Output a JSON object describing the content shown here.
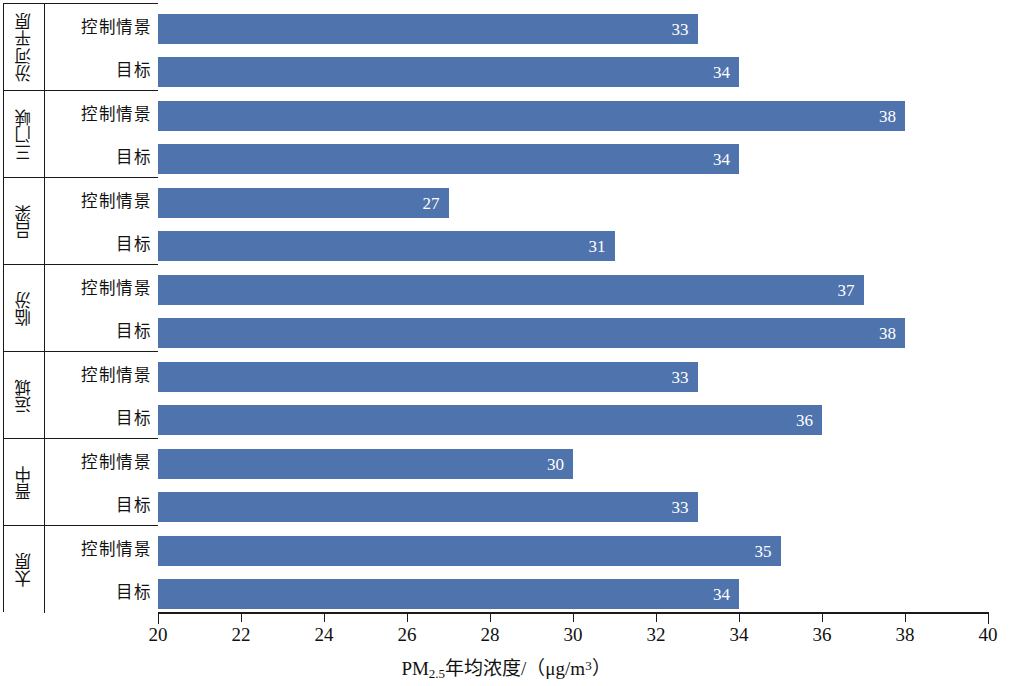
{
  "chart_data": {
    "type": "bar",
    "orientation": "horizontal",
    "title": "",
    "xlabel": "PM2.5年均浓度/（μg/m³）",
    "ylabel": "",
    "xlim": [
      20,
      40
    ],
    "xticks": [
      20,
      22,
      24,
      26,
      28,
      30,
      32,
      34,
      36,
      38,
      40
    ],
    "grid": false,
    "legend": "none",
    "series_names": [
      "控制情景",
      "目标"
    ],
    "categories": [
      "汾河平原",
      "三门峡",
      "吕梁",
      "临汾",
      "运城",
      "晋中",
      "太原"
    ],
    "series": [
      {
        "name": "控制情景",
        "values": [
          33,
          38,
          27,
          37,
          33,
          30,
          35
        ]
      },
      {
        "name": "目标",
        "values": [
          34,
          34,
          31,
          38,
          36,
          33,
          34
        ]
      }
    ],
    "groups": [
      {
        "category": "汾河平原",
        "rows": [
          {
            "label": "控制情景",
            "value": 33
          },
          {
            "label": "目标",
            "value": 34
          }
        ]
      },
      {
        "category": "三门峡",
        "rows": [
          {
            "label": "控制情景",
            "value": 38
          },
          {
            "label": "目标",
            "value": 34
          }
        ]
      },
      {
        "category": "吕梁",
        "rows": [
          {
            "label": "控制情景",
            "value": 27
          },
          {
            "label": "目标",
            "value": 31
          }
        ]
      },
      {
        "category": "临汾",
        "rows": [
          {
            "label": "控制情景",
            "value": 37
          },
          {
            "label": "目标",
            "value": 38
          }
        ]
      },
      {
        "category": "运城",
        "rows": [
          {
            "label": "控制情景",
            "value": 33
          },
          {
            "label": "目标",
            "value": 36
          }
        ]
      },
      {
        "category": "晋中",
        "rows": [
          {
            "label": "控制情景",
            "value": 30
          },
          {
            "label": "目标",
            "value": 33
          }
        ]
      },
      {
        "category": "太原",
        "rows": [
          {
            "label": "控制情景",
            "value": 35
          },
          {
            "label": "目标",
            "value": 34
          }
        ]
      }
    ],
    "colors": {
      "bar": "#4f73ad",
      "axis": "#1a1a1a",
      "value_label": "#ffffff",
      "background": "#ffffff"
    }
  },
  "axis_title_parts": {
    "prefix": "PM",
    "subscript": "2.5",
    "middle": "年均浓度/（μg/m",
    "superscript": "3",
    "suffix": "）"
  }
}
